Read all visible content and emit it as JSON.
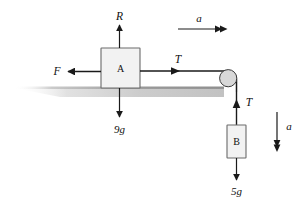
{
  "figure": {
    "kind": "free-body-diagram",
    "background_color": "#ffffff",
    "line_color": "#1a1a1a",
    "block_fill": "#f2f2f2",
    "block_stroke": "#555555",
    "pulley_fill": "#d8d8d8",
    "pulley_stroke": "#333333",
    "surface_color": "#9a9a9a"
  },
  "labels": {
    "normal_reaction": "R",
    "friction": "F",
    "tension_top": "T",
    "tension_side": "T",
    "weight_a": "9g",
    "weight_b": "5g",
    "acceleration_top": "a",
    "acceleration_right": "a",
    "block_a": "A",
    "block_b": "B"
  },
  "elements": {
    "block_a": {
      "name": "A",
      "weight": "9g"
    },
    "block_b": {
      "name": "B",
      "weight": "5g"
    },
    "pulley": {
      "name": "pulley"
    },
    "surface": {
      "name": "horizontal-surface"
    }
  }
}
